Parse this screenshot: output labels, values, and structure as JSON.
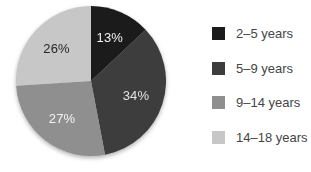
{
  "chart_data": {
    "type": "pie",
    "title": "",
    "legend_position": "right",
    "start_angle_deg": 0,
    "direction": "clockwise",
    "legend_text_color": "#454545",
    "background_color": "#ffffff",
    "slices": [
      {
        "legend_label": "2–5 years",
        "value": 13,
        "value_label": "13%",
        "color": "#1b1b1b",
        "value_label_color": "#f2f2f2"
      },
      {
        "legend_label": "5–9 years",
        "value": 34,
        "value_label": "34%",
        "color": "#3d3d3d",
        "value_label_color": "#e4e4e4"
      },
      {
        "legend_label": "9–14 years",
        "value": 27,
        "value_label": "27%",
        "color": "#8f8f8f",
        "value_label_color": "#f4f4f4"
      },
      {
        "legend_label": "14–18 years",
        "value": 26,
        "value_label": "26%",
        "color": "#c7c7c7",
        "value_label_color": "#262626"
      }
    ]
  }
}
